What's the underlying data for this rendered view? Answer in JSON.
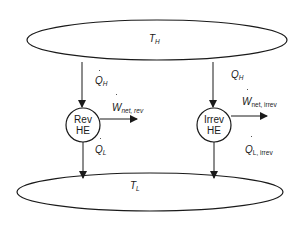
{
  "diagram": {
    "hot_reservoir": {
      "label": "T",
      "subscript": "H"
    },
    "cold_reservoir": {
      "label": "T",
      "subscript": "L"
    },
    "engines": [
      {
        "name_line1": "Rev",
        "name_line2": "HE",
        "heat_in": {
          "label": "Q",
          "subscript": "H"
        },
        "work_out": {
          "label": "W",
          "subscript": "net, rev"
        },
        "heat_out": {
          "label": "Q",
          "subscript": "L"
        }
      },
      {
        "name_line1": "Irrev",
        "name_line2": "HE",
        "heat_in": {
          "label": "Q",
          "subscript": "H"
        },
        "work_out": {
          "label": "W",
          "subscript": "net, irrev"
        },
        "heat_out": {
          "label": "Q",
          "subscript": "L, irrev"
        }
      }
    ],
    "colors": {
      "stroke": "#1a1a1a",
      "background": "#ffffff"
    }
  }
}
